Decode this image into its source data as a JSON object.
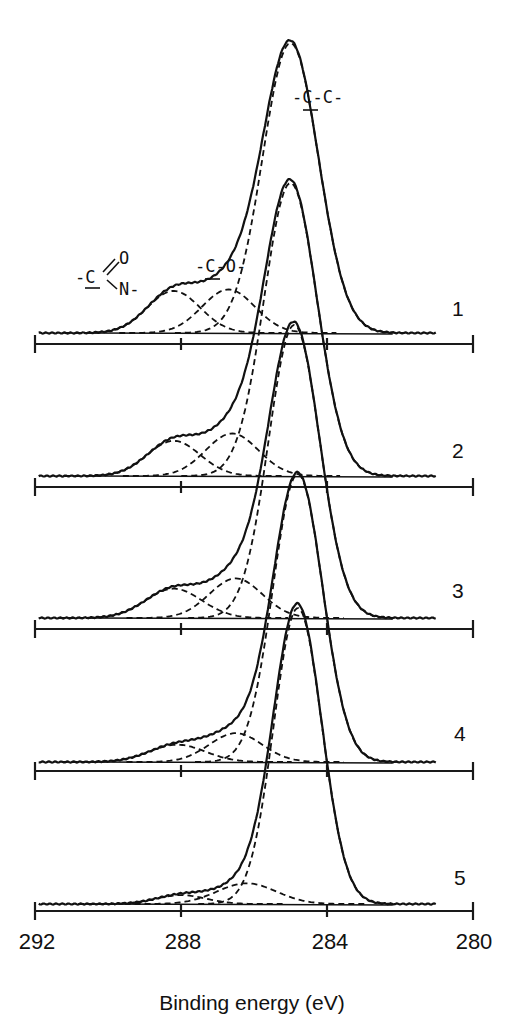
{
  "chart_data": {
    "type": "line",
    "title": "",
    "xlabel": "Binding energy (eV)",
    "ylabel": "",
    "xlim": [
      292,
      280
    ],
    "x_reversed": true,
    "x_ticks": [
      292,
      288,
      284,
      280
    ],
    "grid": false,
    "legend_position": "right (numbered spectrum labels)",
    "annotations": [
      {
        "text": "-C-C-",
        "underlined_atom": "C",
        "assigned_to": "C-C peak ~285.0 eV"
      },
      {
        "text": "-C-O-",
        "underlined_atom": "C",
        "assigned_to": "C-O peak ~286.6 eV"
      },
      {
        "text": "-C(=O)N-",
        "display": [
          "-C",
          "O",
          "N-"
        ],
        "underlined_atom": "C",
        "assigned_to": "amide peak ~288.2 eV"
      }
    ],
    "series": [
      {
        "name": "1",
        "components": [
          {
            "label": "C-C",
            "position_ev": 285.0,
            "relative_height": 1.0,
            "fwhm_ev": 1.8
          },
          {
            "label": "C-O",
            "position_ev": 286.7,
            "relative_height": 0.15,
            "fwhm_ev": 1.7
          },
          {
            "label": "N-C=O",
            "position_ev": 288.2,
            "relative_height": 0.145,
            "fwhm_ev": 1.7
          }
        ]
      },
      {
        "name": "2",
        "components": [
          {
            "label": "C-C",
            "position_ev": 285.0,
            "relative_height": 1.0,
            "fwhm_ev": 1.7
          },
          {
            "label": "C-O",
            "position_ev": 286.6,
            "relative_height": 0.145,
            "fwhm_ev": 1.7
          },
          {
            "label": "N-C=O",
            "position_ev": 288.2,
            "relative_height": 0.12,
            "fwhm_ev": 1.7
          }
        ]
      },
      {
        "name": "3",
        "components": [
          {
            "label": "C-C",
            "position_ev": 284.9,
            "relative_height": 1.0,
            "fwhm_ev": 1.65
          },
          {
            "label": "C-O",
            "position_ev": 286.5,
            "relative_height": 0.135,
            "fwhm_ev": 1.7
          },
          {
            "label": "N-C=O",
            "position_ev": 288.2,
            "relative_height": 0.1,
            "fwhm_ev": 1.8
          }
        ]
      },
      {
        "name": "4",
        "components": [
          {
            "label": "C-C",
            "position_ev": 284.8,
            "relative_height": 1.0,
            "fwhm_ev": 1.6
          },
          {
            "label": "C-O",
            "position_ev": 286.5,
            "relative_height": 0.1,
            "fwhm_ev": 1.7
          },
          {
            "label": "N-C=O",
            "position_ev": 288.1,
            "relative_height": 0.06,
            "fwhm_ev": 1.8
          }
        ]
      },
      {
        "name": "5",
        "components": [
          {
            "label": "C-C",
            "position_ev": 284.8,
            "relative_height": 1.0,
            "fwhm_ev": 1.55
          },
          {
            "label": "C-O",
            "position_ev": 286.2,
            "relative_height": 0.07,
            "fwhm_ev": 1.9
          },
          {
            "label": "N-C=O",
            "position_ev": 288.0,
            "relative_height": 0.03,
            "fwhm_ev": 1.6
          }
        ]
      }
    ]
  },
  "render": {
    "x_px_at_292": 35,
    "px_per_ev": 36.5,
    "spectra": [
      {
        "label": "1",
        "axis_y": 344,
        "baseline_y": 333,
        "peak_px": 290,
        "label_y": 316
      },
      {
        "label": "2",
        "axis_y": 487,
        "baseline_y": 476,
        "peak_px": 293,
        "label_y": 458
      },
      {
        "label": "3",
        "axis_y": 629,
        "baseline_y": 618,
        "peak_px": 293,
        "label_y": 598
      },
      {
        "label": "4",
        "axis_y": 771,
        "baseline_y": 762,
        "peak_px": 288,
        "label_y": 741
      },
      {
        "label": "5",
        "axis_y": 911,
        "baseline_y": 904,
        "peak_px": 296,
        "label_y": 885
      }
    ],
    "tick_label_y": 949,
    "x_title_y": 1010
  },
  "labels": {
    "x_axis_title": "Binding energy (eV)",
    "tick_292": "292",
    "tick_288": "288",
    "tick_284": "284",
    "tick_280": "280",
    "spectrum_1": "1",
    "spectrum_2": "2",
    "spectrum_3": "3",
    "spectrum_4": "4",
    "spectrum_5": "5",
    "cc_label": "-C-C-",
    "co_label": "-C-O-",
    "amide_c": "-C",
    "amide_o": "O",
    "amide_n": "N-"
  }
}
